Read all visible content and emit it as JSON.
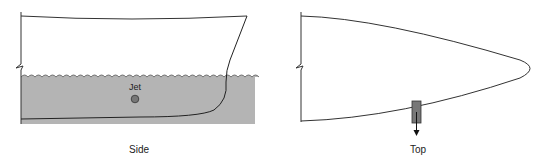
{
  "diagram": {
    "panels": [
      {
        "id": "side",
        "caption": "Side",
        "jet_label": "Jet"
      },
      {
        "id": "top",
        "caption": "Top"
      }
    ],
    "colors": {
      "water": "#b4b4b4",
      "line": "#333333",
      "jet": "#777777"
    }
  }
}
